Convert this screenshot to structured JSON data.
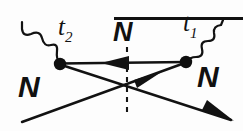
{
  "diagram": {
    "type": "feynman-diagram",
    "background_color": "#fdfdfd",
    "ink_color": "#121212",
    "labels": {
      "vertex_right_label": "t",
      "vertex_right_sub": "1",
      "vertex_left_label": "t",
      "vertex_left_sub": "2",
      "propagator_label": "N",
      "propagator_label_bar": true,
      "incoming_left_label": "N",
      "outgoing_right_label": "N"
    },
    "vertices": [
      {
        "name": "vertex-left",
        "x": 60,
        "y": 64,
        "radius": 6.2,
        "time_label": "t2"
      },
      {
        "name": "vertex-right",
        "x": 186,
        "y": 62,
        "radius": 6.2,
        "time_label": "t1"
      }
    ],
    "wavy_lines": [
      {
        "name": "wavy-left",
        "from_x": 22,
        "from_y": 22,
        "to_x": 60,
        "to_y": 64
      },
      {
        "name": "wavy-right",
        "from_x": 186,
        "from_y": 62,
        "to_x": 223,
        "to_y": 20
      }
    ],
    "propagator": {
      "name": "nbar-propagator",
      "from_x": 186,
      "from_y": 62,
      "to_x": 60,
      "to_y": 64,
      "arrow_direction": "left",
      "arrow_x": 118,
      "arrow_y": 63
    },
    "fermion_lines": [
      {
        "name": "incoming-nucleon-line",
        "from_x": 22,
        "from_y": 122,
        "to_x": 186,
        "to_y": 62,
        "arrow_direction": "up-right",
        "arrow_x": 156,
        "arrow_y": 73
      },
      {
        "name": "outgoing-nucleon-line",
        "from_x": 60,
        "from_y": 64,
        "to_x": 230,
        "to_y": 120,
        "arrow_direction": "down-right",
        "arrow_x": 226,
        "arrow_y": 118
      }
    ],
    "cut_line": {
      "name": "vertical-cut-dashed",
      "x": 127,
      "from_y": 48,
      "to_y": 112,
      "style": "dashed"
    }
  }
}
